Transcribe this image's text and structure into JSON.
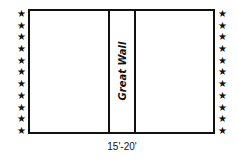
{
  "diagram": {
    "center_label": "Great Wall",
    "dimension_label": "15'-20'",
    "star_glyph": "★",
    "left_star_count": 11,
    "right_star_count": 11,
    "line_color": "#111111"
  }
}
